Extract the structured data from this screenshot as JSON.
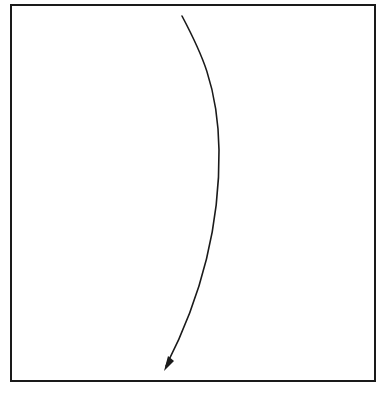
{
  "diagram": {
    "type": "single-arrow-in-frame",
    "canvas": {
      "width": 377,
      "height": 395,
      "background": "#ffffff"
    },
    "frame": {
      "x": 11,
      "y": 5,
      "width": 364,
      "height": 376,
      "stroke": "#1a1a1a",
      "stroke_width": 2
    },
    "arrow": {
      "path": "M 182 16 C 200 50, 218 85, 219 150 C 220 230, 200 300, 166 366",
      "stroke": "#1a1a1a",
      "stroke_width": 1.6,
      "head_polygon": "164,371 168,356 174,361",
      "direction": "downward"
    }
  }
}
